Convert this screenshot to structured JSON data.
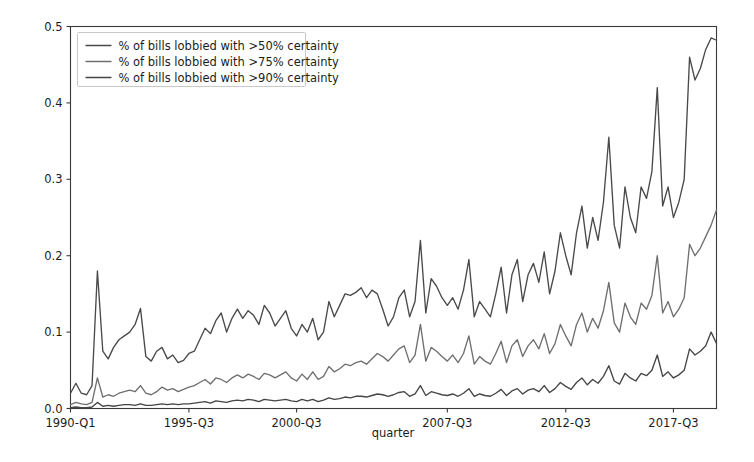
{
  "chart_data": {
    "type": "line",
    "title": "",
    "xlabel": "quarter",
    "ylabel": "",
    "ylim": [
      0.0,
      0.5
    ],
    "grid": false,
    "legend_position": "upper left",
    "ytick_labels": [
      "0.0",
      "0.1",
      "0.2",
      "0.3",
      "0.4",
      "0.5"
    ],
    "ytick_values": [
      0.0,
      0.1,
      0.2,
      0.3,
      0.4,
      0.5
    ],
    "xtick_labels": [
      "1990-Q1",
      "1995-Q3",
      "2000-Q3",
      "2007-Q3",
      "2012-Q3",
      "2017-Q3"
    ],
    "xtick_indices": [
      0,
      22,
      42,
      70,
      92,
      112
    ],
    "n_points": 121,
    "colors": {
      "series_50": "#4a4a4a",
      "series_75": "#6f6f6f",
      "series_90": "#454545",
      "axis": "#3a3a3a",
      "text": "#1c1c1c",
      "background": "#ffffff"
    },
    "series": [
      {
        "name": "% of bills lobbied with >50% certainty",
        "color": "#4a4a4a",
        "values": [
          0.02,
          0.033,
          0.02,
          0.018,
          0.03,
          0.18,
          0.075,
          0.065,
          0.08,
          0.09,
          0.095,
          0.1,
          0.11,
          0.131,
          0.068,
          0.062,
          0.075,
          0.08,
          0.065,
          0.07,
          0.06,
          0.063,
          0.072,
          0.075,
          0.09,
          0.105,
          0.098,
          0.115,
          0.125,
          0.1,
          0.118,
          0.13,
          0.118,
          0.128,
          0.122,
          0.11,
          0.135,
          0.125,
          0.108,
          0.118,
          0.128,
          0.105,
          0.095,
          0.11,
          0.1,
          0.118,
          0.09,
          0.1,
          0.14,
          0.12,
          0.135,
          0.15,
          0.148,
          0.152,
          0.158,
          0.145,
          0.155,
          0.15,
          0.13,
          0.108,
          0.12,
          0.145,
          0.155,
          0.12,
          0.14,
          0.22,
          0.125,
          0.17,
          0.16,
          0.145,
          0.135,
          0.145,
          0.13,
          0.155,
          0.195,
          0.12,
          0.14,
          0.13,
          0.12,
          0.15,
          0.185,
          0.125,
          0.175,
          0.195,
          0.14,
          0.175,
          0.19,
          0.165,
          0.205,
          0.15,
          0.18,
          0.23,
          0.2,
          0.175,
          0.23,
          0.265,
          0.21,
          0.25,
          0.22,
          0.27,
          0.355,
          0.24,
          0.21,
          0.29,
          0.25,
          0.23,
          0.29,
          0.275,
          0.31,
          0.42,
          0.265,
          0.29,
          0.25,
          0.27,
          0.3,
          0.46,
          0.43,
          0.445,
          0.47,
          0.485,
          0.482
        ]
      },
      {
        "name": "% of bills lobbied with >75% certainty",
        "color": "#6f6f6f",
        "values": [
          0.005,
          0.008,
          0.006,
          0.005,
          0.008,
          0.04,
          0.015,
          0.018,
          0.016,
          0.02,
          0.022,
          0.024,
          0.022,
          0.03,
          0.02,
          0.018,
          0.022,
          0.028,
          0.024,
          0.026,
          0.022,
          0.025,
          0.028,
          0.03,
          0.034,
          0.038,
          0.032,
          0.04,
          0.038,
          0.034,
          0.04,
          0.044,
          0.04,
          0.045,
          0.042,
          0.038,
          0.046,
          0.044,
          0.04,
          0.044,
          0.048,
          0.04,
          0.036,
          0.045,
          0.038,
          0.048,
          0.038,
          0.042,
          0.055,
          0.048,
          0.052,
          0.058,
          0.056,
          0.06,
          0.062,
          0.058,
          0.065,
          0.072,
          0.068,
          0.062,
          0.07,
          0.078,
          0.082,
          0.06,
          0.07,
          0.11,
          0.062,
          0.08,
          0.075,
          0.068,
          0.062,
          0.07,
          0.06,
          0.072,
          0.095,
          0.058,
          0.068,
          0.062,
          0.058,
          0.072,
          0.088,
          0.06,
          0.082,
          0.09,
          0.068,
          0.082,
          0.09,
          0.078,
          0.098,
          0.072,
          0.085,
          0.11,
          0.095,
          0.082,
          0.11,
          0.125,
          0.1,
          0.118,
          0.105,
          0.128,
          0.165,
          0.112,
          0.1,
          0.138,
          0.12,
          0.11,
          0.138,
          0.13,
          0.148,
          0.2,
          0.125,
          0.14,
          0.12,
          0.13,
          0.145,
          0.215,
          0.2,
          0.21,
          0.225,
          0.24,
          0.26
        ]
      },
      {
        "name": "% of bills lobbied with >90% certainty",
        "color": "#454545",
        "values": [
          0.001,
          0.002,
          0.001,
          0.001,
          0.002,
          0.008,
          0.003,
          0.004,
          0.003,
          0.004,
          0.005,
          0.005,
          0.004,
          0.006,
          0.004,
          0.004,
          0.005,
          0.006,
          0.005,
          0.006,
          0.005,
          0.006,
          0.006,
          0.007,
          0.008,
          0.009,
          0.007,
          0.01,
          0.009,
          0.008,
          0.01,
          0.011,
          0.01,
          0.012,
          0.011,
          0.009,
          0.012,
          0.011,
          0.01,
          0.011,
          0.012,
          0.01,
          0.009,
          0.012,
          0.01,
          0.012,
          0.009,
          0.011,
          0.014,
          0.012,
          0.013,
          0.015,
          0.014,
          0.016,
          0.016,
          0.015,
          0.017,
          0.019,
          0.018,
          0.016,
          0.018,
          0.021,
          0.022,
          0.016,
          0.019,
          0.03,
          0.017,
          0.022,
          0.02,
          0.018,
          0.017,
          0.019,
          0.016,
          0.02,
          0.026,
          0.016,
          0.019,
          0.017,
          0.016,
          0.02,
          0.025,
          0.017,
          0.023,
          0.026,
          0.019,
          0.024,
          0.026,
          0.022,
          0.03,
          0.021,
          0.026,
          0.034,
          0.029,
          0.025,
          0.034,
          0.04,
          0.031,
          0.038,
          0.033,
          0.042,
          0.056,
          0.036,
          0.032,
          0.046,
          0.04,
          0.036,
          0.046,
          0.043,
          0.05,
          0.07,
          0.042,
          0.048,
          0.04,
          0.044,
          0.05,
          0.078,
          0.07,
          0.075,
          0.082,
          0.1,
          0.085
        ]
      }
    ]
  }
}
